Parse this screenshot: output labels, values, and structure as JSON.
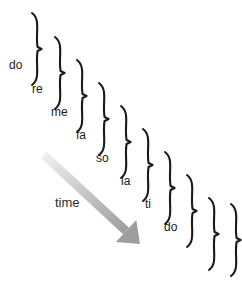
{
  "figure": {
    "title": "",
    "background_color": "#ffffff",
    "width": 242,
    "height": 285
  },
  "axis": {
    "label": "time",
    "arrow_color": "#9e9e9e",
    "arrow_color_start": "#ededed",
    "label_x": 55,
    "label_y": 196,
    "arrow_start_x": 44,
    "arrow_start_y": 155,
    "arrow_end_x": 140,
    "arrow_end_y": 244
  },
  "braces": {
    "color": "#1a1a1a",
    "stroke_width": 2.1,
    "items": [
      {
        "label": "do",
        "x": 32,
        "y": 13,
        "height": 72,
        "label_x": 9,
        "label_y": 59
      },
      {
        "label": "re",
        "x": 55,
        "y": 37,
        "height": 72,
        "label_x": 32,
        "label_y": 83
      },
      {
        "label": "me",
        "x": 77,
        "y": 60,
        "height": 72,
        "label_x": 51,
        "label_y": 106
      },
      {
        "label": "fa",
        "x": 99,
        "y": 83,
        "height": 72,
        "label_x": 76,
        "label_y": 129
      },
      {
        "label": "so",
        "x": 121,
        "y": 106,
        "height": 72,
        "label_x": 96,
        "label_y": 152
      },
      {
        "label": "la",
        "x": 143,
        "y": 129,
        "height": 72,
        "label_x": 121,
        "label_y": 175
      },
      {
        "label": "ti",
        "x": 165,
        "y": 152,
        "height": 72,
        "label_x": 145,
        "label_y": 198
      },
      {
        "label": "do",
        "x": 187,
        "y": 175,
        "height": 72,
        "label_x": 164,
        "label_y": 221
      },
      {
        "label": "",
        "x": 209,
        "y": 198,
        "height": 72,
        "label_x": 0,
        "label_y": 0
      },
      {
        "label": "",
        "x": 231,
        "y": 204,
        "height": 72,
        "label_x": 0,
        "label_y": 0
      }
    ]
  }
}
